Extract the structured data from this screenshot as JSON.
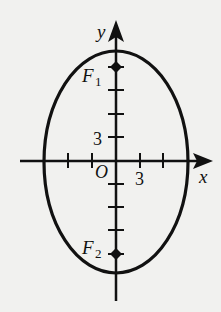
{
  "diagram": {
    "type": "ellipse-with-foci",
    "axes": {
      "x_label": "x",
      "y_label": "y",
      "origin_label": "O"
    },
    "tick_labels": {
      "x_tick": "3",
      "y_tick": "3"
    },
    "foci": [
      {
        "label": "F",
        "subscript": "1"
      },
      {
        "label": "F",
        "subscript": "2"
      }
    ],
    "colors": {
      "background": "#f1f1ef",
      "ink": "#111111"
    }
  }
}
